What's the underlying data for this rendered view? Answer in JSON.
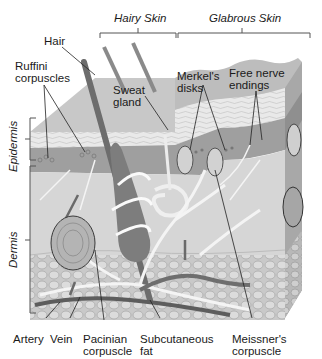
{
  "diagram": {
    "regions": {
      "hairy_skin": "Hairy Skin",
      "glabrous_skin": "Glabrous Skin"
    },
    "layers": {
      "epidermis": "Epidermis",
      "dermis": "Dermis"
    },
    "labels": {
      "hair": "Hair",
      "ruffini_1": "Ruffini",
      "ruffini_2": "corpuscles",
      "sweat_1": "Sweat",
      "sweat_2": "gland",
      "merkel_1": "Merkel's",
      "merkel_2": "disks",
      "free_1": "Free nerve",
      "free_2": "endings",
      "artery": "Artery",
      "vein": "Vein",
      "pacinian_1": "Pacinian",
      "pacinian_2": "corpuscle",
      "subcut_1": "Subcutaneous",
      "subcut_2": "fat",
      "meissner_1": "Meissner's",
      "meissner_2": "corpuscle"
    }
  }
}
